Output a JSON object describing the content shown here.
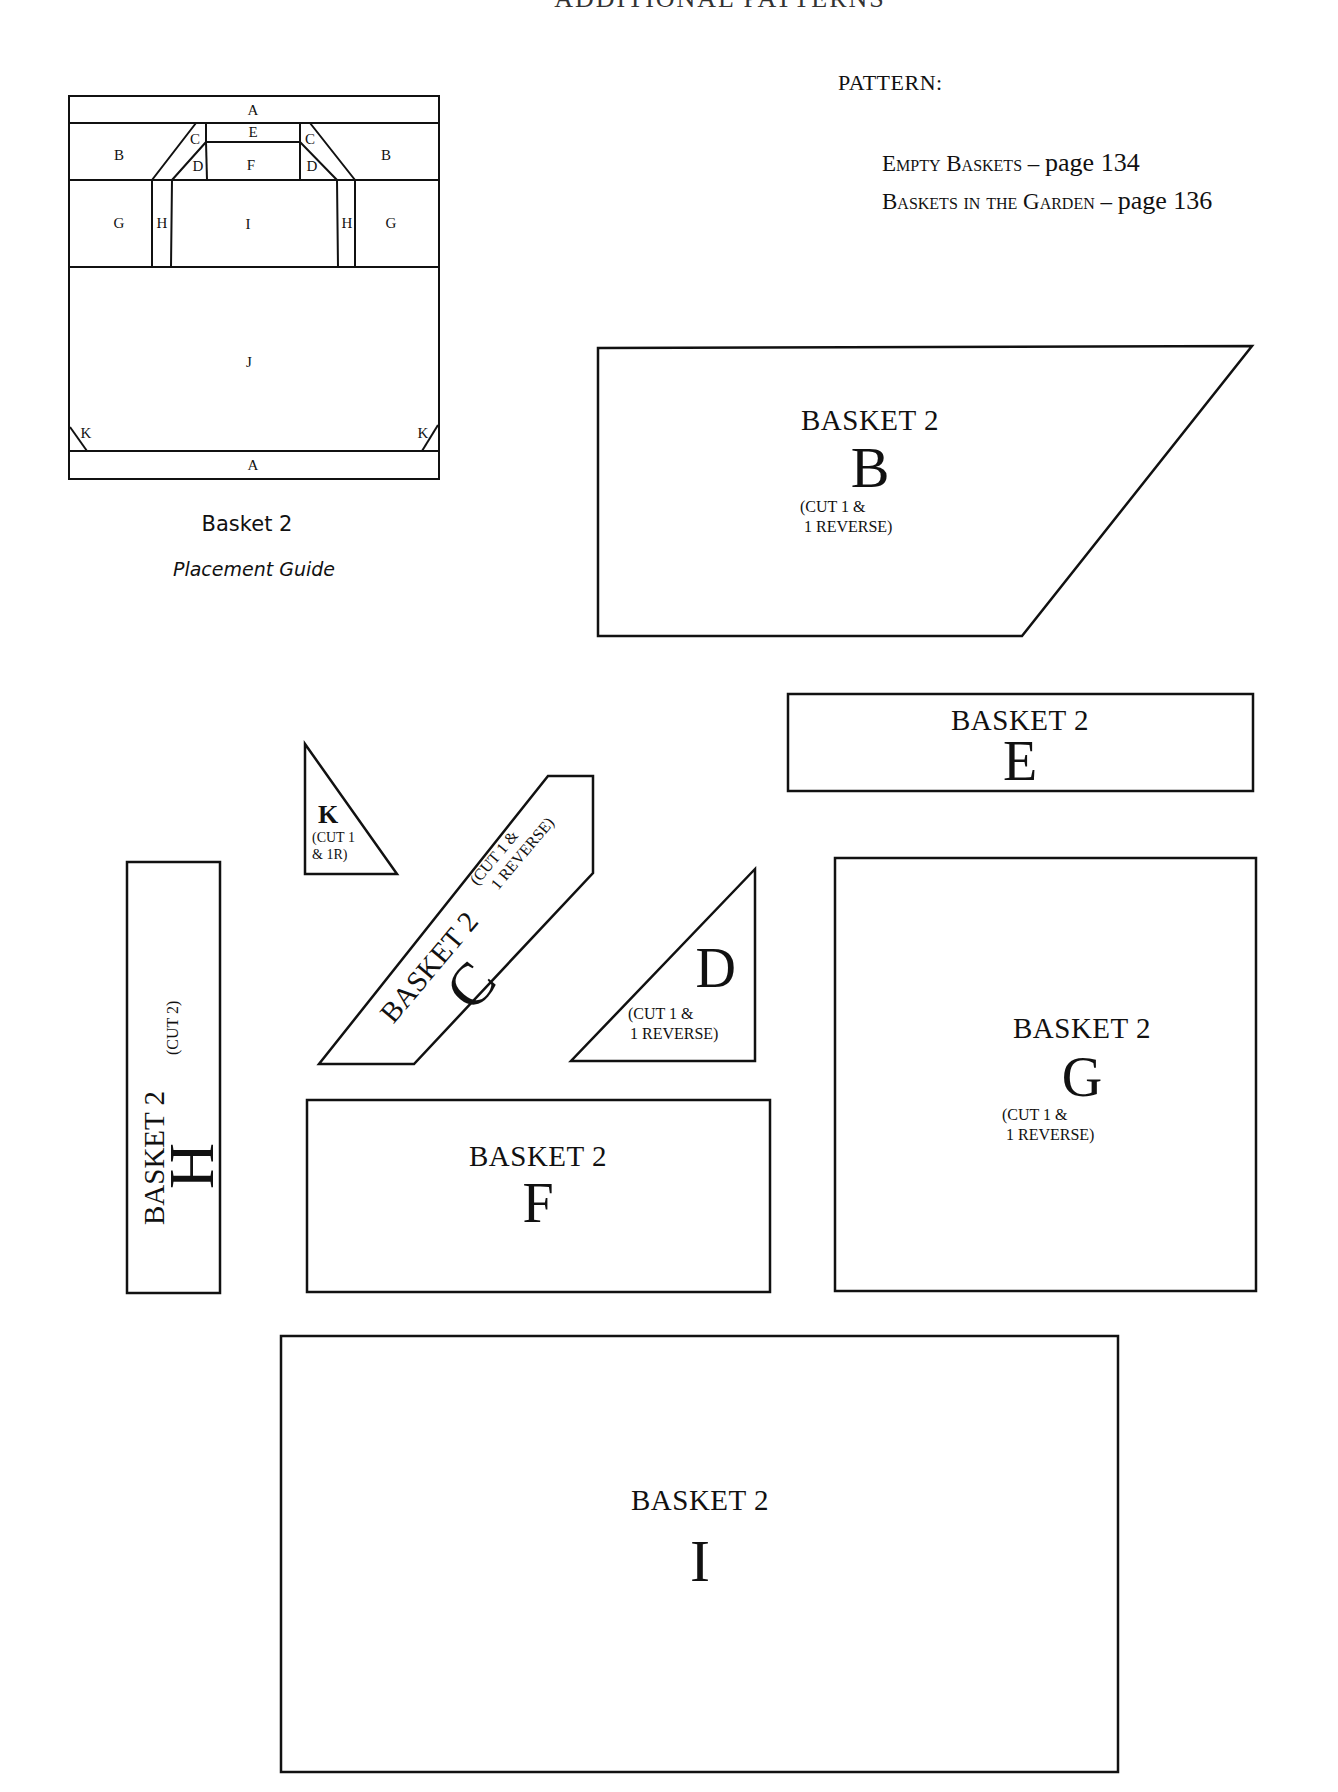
{
  "header": {
    "title_clipped": "ADDITIONAL PATTERNS"
  },
  "pattern_section": {
    "label": "PATTERN:",
    "links": [
      {
        "name": "Empty Baskets",
        "sep": " – ",
        "page": "page 134"
      },
      {
        "name": "Baskets in the Garden",
        "sep": " – ",
        "page": "page 136"
      }
    ]
  },
  "placement_guide": {
    "caption": "Basket 2",
    "subcaption": "Placement Guide",
    "labels": {
      "A_top": "A",
      "A_bottom": "A",
      "B_left": "B",
      "B_right": "B",
      "C_left": "C",
      "C_right": "C",
      "D_left": "D",
      "D_right": "D",
      "E": "E",
      "F": "F",
      "G_left": "G",
      "G_right": "G",
      "H_left": "H",
      "H_right": "H",
      "I": "I",
      "J": "J",
      "K_left": "K",
      "K_right": "K"
    }
  },
  "pieces": {
    "B": {
      "title": "BASKET 2",
      "letter": "B",
      "note1": "(CUT 1 &",
      "note2": "1 REVERSE)"
    },
    "E": {
      "title": "BASKET 2",
      "letter": "E"
    },
    "K": {
      "letter": "K",
      "note1": "(CUT 1",
      "note2": "& 1R)"
    },
    "C": {
      "title": "BASKET 2",
      "letter": "C",
      "note1": "(CUT 1 &",
      "note2": "1 REVERSE)"
    },
    "D": {
      "letter": "D",
      "note1": "(CUT 1 &",
      "note2": "1 REVERSE)"
    },
    "H": {
      "title": "BASKET 2",
      "letter": "H",
      "note": "(CUT 2)"
    },
    "F": {
      "title": "BASKET 2",
      "letter": "F"
    },
    "G": {
      "title": "BASKET 2",
      "letter": "G",
      "note1": "(CUT 1 &",
      "note2": "1 REVERSE)"
    },
    "I": {
      "title": "BASKET 2",
      "letter": "I"
    }
  }
}
